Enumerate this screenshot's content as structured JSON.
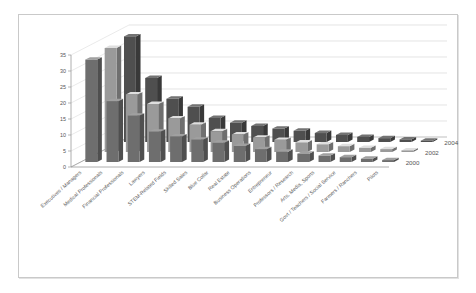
{
  "chart_data": {
    "type": "bar",
    "title": "",
    "subtitle": "",
    "xlabel": "",
    "ylabel": "",
    "ylim": [
      0,
      35
    ],
    "yticks": [
      0,
      5,
      10,
      15,
      20,
      25,
      30,
      35
    ],
    "grid": true,
    "three_d": true,
    "legend_position": "right-depth-axis",
    "categories": [
      "Executives / Managers",
      "Medical Professionals",
      "Financial Professionals",
      "Lawyers",
      "STEM-Related Fields",
      "Skilled Sales",
      "Blue Collar",
      "Real Estate",
      "Business Operations",
      "Entrepreneur",
      "Professors / Research",
      "Arts, Media, Sports",
      "Govt / Teachers / Social Service",
      "Farmers / Ranchers",
      "Pilots"
    ],
    "series": [
      {
        "name": "2000",
        "color": "#6e6e6e",
        "values": [
          32.0,
          19.0,
          14.5,
          9.5,
          8.0,
          7.0,
          6.0,
          5.0,
          4.0,
          3.2,
          2.6,
          2.0,
          1.5,
          1.0,
          0.6
        ]
      },
      {
        "name": "2002",
        "color": "#9a9a9a",
        "values": [
          32.5,
          18.0,
          15.0,
          10.5,
          8.5,
          6.5,
          5.5,
          4.5,
          3.8,
          3.0,
          2.4,
          1.8,
          1.3,
          0.9,
          0.5
        ]
      },
      {
        "name": "2004",
        "color": "#4f4f4f",
        "values": [
          33.0,
          20.0,
          13.5,
          11.0,
          7.5,
          6.0,
          5.0,
          4.2,
          3.5,
          2.8,
          2.2,
          1.6,
          1.2,
          0.8,
          0.4
        ]
      }
    ]
  },
  "legend": {
    "entries": [
      "2004",
      "2002",
      "2000"
    ]
  },
  "axis": {
    "y_tick_labels": [
      "0",
      "5",
      "10",
      "15",
      "20",
      "25",
      "30",
      "35"
    ]
  }
}
